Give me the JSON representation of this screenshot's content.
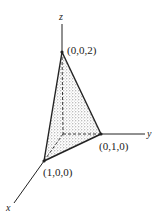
{
  "figure": {
    "type": "3d-tetrahedron",
    "axes": {
      "x_label": "x",
      "y_label": "y",
      "z_label": "z"
    },
    "vertices": [
      {
        "label": "(0,0,2)",
        "coords": [
          0,
          0,
          2
        ]
      },
      {
        "label": "(0,1,0)",
        "coords": [
          0,
          1,
          0
        ]
      },
      {
        "label": "(1,0,0)",
        "coords": [
          1,
          0,
          0
        ]
      }
    ],
    "colors": {
      "line": "#222222",
      "shade": "#bbbbbb",
      "background": "#ffffff"
    }
  }
}
